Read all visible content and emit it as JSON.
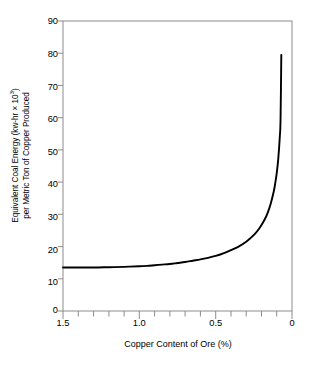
{
  "chart_data": {
    "type": "line",
    "title": "",
    "xlabel": "Copper Content of Ore (%)",
    "ylabel_line1_prefix": "Equivalent Coal Energy (kw-hr × 10",
    "ylabel_line1_exponent": "3",
    "ylabel_line1_suffix": ")",
    "ylabel_line2": "per Metric Ton of Copper Produced",
    "ylabel_full": "Equivalent Coal Energy (kw-hr × 10³) per Metric Ton of Copper Produced",
    "xlim": [
      1.5,
      0.0
    ],
    "ylim": [
      0,
      90
    ],
    "x_reversed": true,
    "grid": false,
    "legend": null,
    "xticks": [
      1.5,
      1.0,
      0.5,
      0.0
    ],
    "xticklabels": [
      "1.5",
      "1.0",
      "0.5",
      "0"
    ],
    "x_minor_tick_step": 0.1,
    "yticks": [
      0,
      10,
      20,
      30,
      40,
      50,
      60,
      70,
      80,
      90
    ],
    "yticklabels": [
      "0",
      "10",
      "20",
      "30",
      "40",
      "50",
      "60",
      "70",
      "80",
      "90"
    ],
    "line_color": "#000000",
    "line_width": 1.9,
    "axis_color": "#888888",
    "series": [
      {
        "name": "Equivalent coal energy",
        "x": [
          1.5,
          1.4,
          1.3,
          1.2,
          1.1,
          1.0,
          0.95,
          0.9,
          0.85,
          0.8,
          0.75,
          0.7,
          0.65,
          0.6,
          0.55,
          0.5,
          0.45,
          0.4,
          0.35,
          0.3,
          0.27,
          0.24,
          0.21,
          0.18,
          0.16,
          0.14,
          0.12,
          0.11,
          0.1,
          0.09,
          0.08,
          0.075,
          0.07
        ],
        "y": [
          13.5,
          13.5,
          13.5,
          13.6,
          13.7,
          13.9,
          14.0,
          14.2,
          14.4,
          14.6,
          14.9,
          15.2,
          15.6,
          16.0,
          16.5,
          17.1,
          17.9,
          18.9,
          20.0,
          21.5,
          22.7,
          24.1,
          25.9,
          28.3,
          30.4,
          33.2,
          37.0,
          39.6,
          42.8,
          47.2,
          54.0,
          59.5,
          79.5
        ]
      }
    ],
    "annotations": []
  },
  "axes": {
    "ytick_top_value": "90",
    "ytick_bottom_value": "0",
    "xtick_left_value": "1.5",
    "xtick_right_value": "0"
  }
}
